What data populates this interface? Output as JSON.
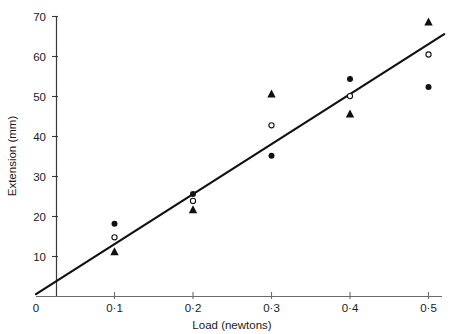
{
  "chart_data": {
    "type": "scatter",
    "title": "",
    "xlabel": "Load (newtons)",
    "ylabel": "Extension (mm)",
    "xlim": [
      0,
      0.55
    ],
    "ylim": [
      0,
      72
    ],
    "grid": false,
    "legend": "none",
    "x_tick_labels": [
      "0",
      "0·1",
      "0·2",
      "0·3",
      "0·4",
      "0·5"
    ],
    "x_tick_values": [
      0,
      0.1,
      0.2,
      0.3,
      0.4,
      0.5
    ],
    "y_tick_labels": [
      "0",
      "10",
      "20",
      "30",
      "40",
      "50",
      "60",
      "70"
    ],
    "y_tick_values": [
      0,
      10,
      20,
      30,
      40,
      50,
      60,
      70
    ],
    "x": [
      0.1,
      0.2,
      0.3,
      0.4,
      0.5
    ],
    "series": [
      {
        "name": "filled-circle",
        "marker": "filled-circle",
        "color": "#111111",
        "values": [
          18.2,
          25.6,
          35.2,
          54.4,
          52.4
        ]
      },
      {
        "name": "open-circle",
        "marker": "open-circle",
        "color": "#111111",
        "values": [
          14.8,
          23.9,
          42.8,
          50.1,
          60.5
        ]
      },
      {
        "name": "filled-triangle",
        "marker": "filled-triangle",
        "color": "#111111",
        "values": [
          11.1,
          21.6,
          50.5,
          45.5,
          68.5
        ]
      }
    ],
    "fit_line": {
      "name": "best-fit-line",
      "x_start": 0.0,
      "y_start": 0.6,
      "x_end": 0.52,
      "y_end": 65.6,
      "color": "#111111"
    },
    "axis_color": "#3a3a3a"
  }
}
